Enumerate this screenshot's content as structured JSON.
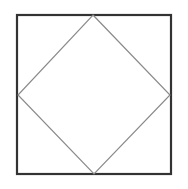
{
  "diagram": {
    "outer_square": {
      "x": 17,
      "y": 15,
      "width": 154,
      "height": 159,
      "stroke": "#333333",
      "stroke_width": 2.2
    },
    "inner_diamond": {
      "points": "93,15 170,95 94,174 18,95",
      "stroke": "#8a8a8a",
      "stroke_width": 1.2
    }
  }
}
